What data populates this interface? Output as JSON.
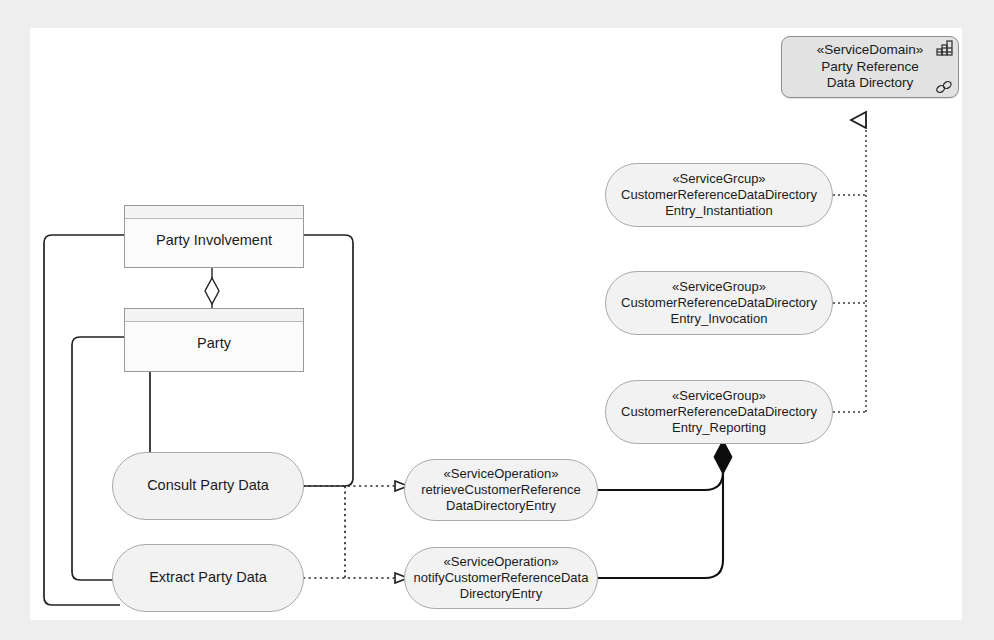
{
  "diagram": {
    "title": "Party Reference Data Directory service realization diagram",
    "canvas_bg": "#ffffff",
    "page_bg": "#eeeeee",
    "line_color": "#222222"
  },
  "service_domain": {
    "stereotype": "«ServiceDomain»",
    "name_line1": "Party Reference",
    "name_line2": "Data Directory",
    "icon_grid": "grid-icon",
    "icon_link": "link-icon"
  },
  "service_groups": [
    {
      "stereotype": "«ServiceGrcup»",
      "name_line1": "CustomerReferenceDataDirectory",
      "name_line2": "Entry_Instantiation"
    },
    {
      "stereotype": "«ServiceGroup»",
      "name_line1": "CustomerReferenceDataDirectory",
      "name_line2": "Entry_Invocation"
    },
    {
      "stereotype": "«ServiceGroup»",
      "name_line1": "CustomerReferenceDataDirectory",
      "name_line2": "Entry_Reporting"
    }
  ],
  "service_operations": [
    {
      "stereotype": "«ServiceOperation»",
      "name_line1": "retrieveCustomerReference",
      "name_line2": "DataDirectoryEntry"
    },
    {
      "stereotype": "«ServiceOperation»",
      "name_line1": "notifyCustomerReferenceData",
      "name_line2": "DirectoryEntry"
    }
  ],
  "classes": [
    {
      "label": "Party Involvement"
    },
    {
      "label": "Party"
    }
  ],
  "activities": [
    {
      "label": "Consult Party Data"
    },
    {
      "label": "Extract Party Data"
    }
  ],
  "relationships": [
    {
      "kind": "aggregation",
      "from": "Party",
      "to": "Party Involvement",
      "marker": "hollow-diamond"
    },
    {
      "kind": "realization",
      "from": "Consult Party Data",
      "to": "retrieveCustomerReferenceDataDirectoryEntry",
      "marker": "hollow-triangle"
    },
    {
      "kind": "realization",
      "from": "Extract Party Data",
      "to": "notifyCustomerReferenceDataDirectoryEntry",
      "marker": "hollow-triangle"
    },
    {
      "kind": "composition",
      "from": "service operations",
      "to": "CustomerReferenceDataDirectoryEntry_Reporting",
      "marker": "filled-diamond"
    },
    {
      "kind": "realization",
      "from": "service groups",
      "to": "Party Reference Data Directory",
      "marker": "hollow-triangle"
    },
    {
      "kind": "association",
      "from": "Party Involvement",
      "to": "Consult Party Data",
      "marker": "none"
    },
    {
      "kind": "association",
      "from": "Party",
      "to": "Extract Party Data",
      "marker": "none"
    },
    {
      "kind": "association",
      "from": "Party",
      "to": "Consult Party Data",
      "marker": "none"
    }
  ]
}
